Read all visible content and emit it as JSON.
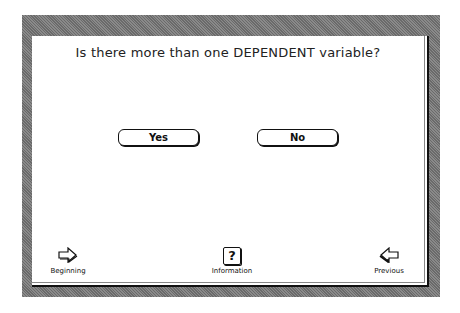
{
  "screen": {
    "question": "Is there more than one DEPENDENT variable?"
  },
  "buttons": {
    "yes_label": "Yes",
    "no_label": "No"
  },
  "navigation": {
    "beginning": {
      "label": "Beginning",
      "icon": "right-arrow-icon"
    },
    "information": {
      "label": "Information",
      "icon": "question-mark-icon",
      "glyph": "?"
    },
    "previous": {
      "label": "Previous",
      "icon": "left-arrow-icon"
    }
  },
  "colors": {
    "frame": "#7a7a7a",
    "card": "#ffffff",
    "text": "#222222"
  }
}
